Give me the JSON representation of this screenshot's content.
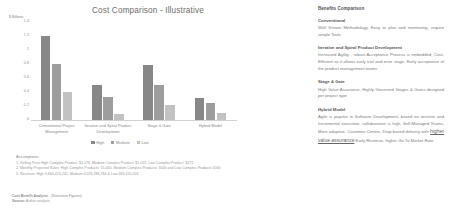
{
  "chart_data": {
    "type": "bar",
    "title": "Cost Comparison - Illustrative",
    "ylabel": "$ Billions",
    "xlabel": "",
    "ylim": [
      0,
      1.4
    ],
    "yticks": [
      "1.4",
      "1.2",
      "1",
      "0.8",
      "0.6",
      "0.4",
      "0.2",
      "0"
    ],
    "grid": false,
    "legend_position": "bottom",
    "categories": [
      "Conventional Project Management",
      "Iterative and Spiral Product Development",
      "Stage & Gate",
      "Hybrid Model"
    ],
    "series": [
      {
        "name": "High",
        "color": "#878787",
        "values": [
          1.2,
          0.5,
          0.78,
          0.32
        ]
      },
      {
        "name": "Medium",
        "color": "#9d9d9d",
        "values": [
          0.8,
          0.33,
          0.5,
          0.24
        ]
      },
      {
        "name": "Low",
        "color": "#c2c2c2",
        "values": [
          0.4,
          0.08,
          0.22,
          0.1
        ]
      }
    ]
  },
  "assumptions": {
    "title": "Assumptions:",
    "lines": [
      "1. Selling Price High Complex Product: $4,076, Medium Complex Product: $1,055, Low Complex Product: $272",
      "2. Monthly Projected Sales: High Complex Products: 15,000, Medium Complex Products: 3000 and Low Complex Products 1000",
      "3. Revenue: High 3,664,474,241, Medium 4,076,286,784 & Low 469,120,424"
    ]
  },
  "footer": {
    "line1_bold": "Cost Benefit Analysis",
    "line1_rest": " - (Illustrative Figures)",
    "line2_bold": "Source:",
    "line2_rest": " Author analysis"
  },
  "benefits": {
    "title": "Benefits Comparison",
    "blocks": [
      {
        "heading": "Conventional",
        "body": "Well Known Methodology, Easy to plan and monitoring, require simple Tools"
      },
      {
        "heading": "Iterative and Spiral Product Development",
        "body": "Increased Agility , robust Acceptance Process is embedded, Cost-Efficient as it allows early trial and error stage, Early acceptance of the product management teams"
      },
      {
        "heading": "Stage & Gate",
        "body": "High Value Assurance, Highly Governed Stages & Gates designed per project type"
      },
      {
        "heading": "Hybrid Model",
        "body_pre": "Agile is popular in Software Development, based on iterative and Incremental execution, collaboration is high, Self-Managed Teams, More adaptive, Customer-Centric, Drop based delivery with ",
        "body_underlined": "higher value assurance",
        "body_post": " Early Revenue, higher Go To Market Rate"
      }
    ]
  }
}
